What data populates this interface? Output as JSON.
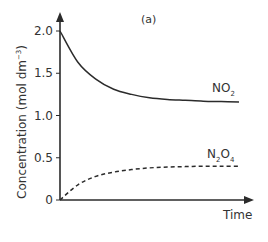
{
  "chart_data": {
    "type": "line",
    "title": "(a)",
    "xlabel": "Time",
    "ylabel": "Concentration (mol dm⁻³)",
    "ylabel_main": "Concentration (mol dm",
    "ylabel_sup": "−3",
    "ylabel_close": ")",
    "ylim": [
      0,
      2.0
    ],
    "yticks": [
      "0",
      "0.5",
      "1.0",
      "1.5",
      "2.0"
    ],
    "ytick_values": [
      0,
      0.5,
      1.0,
      1.5,
      2.0
    ],
    "x_ticks_shown": false,
    "grid": false,
    "legend": "inline labels at line ends",
    "x": [
      0,
      0.1,
      0.2,
      0.3,
      0.4,
      0.5,
      0.6,
      0.7,
      0.8,
      0.9,
      1.0
    ],
    "series": [
      {
        "name": "NO2",
        "label_main": "NO",
        "label_sub": "2",
        "style": "solid",
        "values": [
          2.0,
          1.63,
          1.43,
          1.31,
          1.25,
          1.21,
          1.19,
          1.18,
          1.17,
          1.165,
          1.16
        ]
      },
      {
        "name": "N2O4",
        "label_parts": [
          "N",
          "2",
          "O",
          "4"
        ],
        "style": "dashed",
        "values": [
          0.0,
          0.18,
          0.28,
          0.33,
          0.36,
          0.38,
          0.39,
          0.395,
          0.4,
          0.4,
          0.4
        ]
      }
    ],
    "colors": {
      "line": "#2b2b2b",
      "axis": "#2b2b2b",
      "text": "#333333"
    }
  }
}
